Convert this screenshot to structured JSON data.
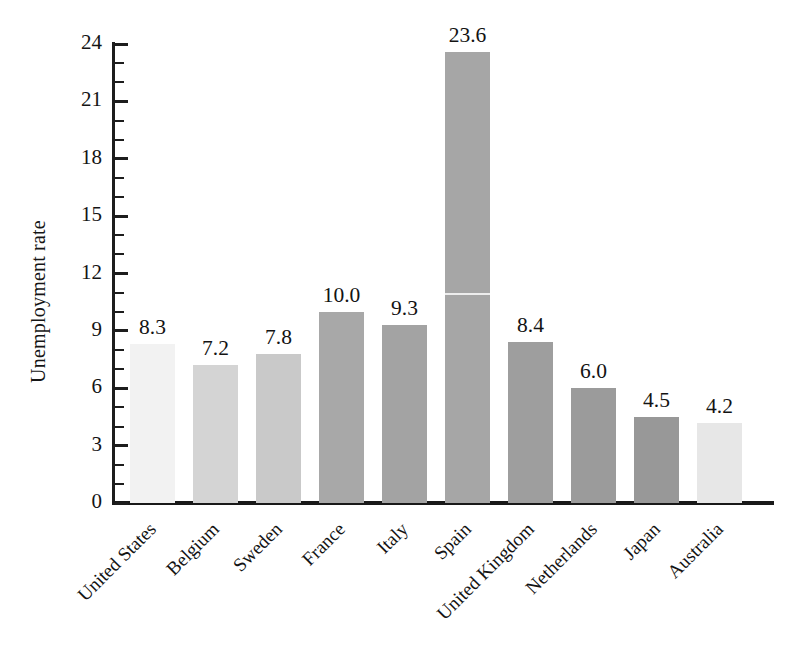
{
  "chart_data": {
    "type": "bar",
    "title": "",
    "xlabel": "",
    "ylabel": "Unemployment rate",
    "ylim": [
      0,
      24
    ],
    "ytick_step": 3,
    "yminor_step": 1,
    "grid": false,
    "legend": "none",
    "categories": [
      "United States",
      "Belgium",
      "Sweden",
      "France",
      "Italy",
      "Spain",
      "United Kingdom",
      "Netherlands",
      "Japan",
      "Australia"
    ],
    "values": [
      8.3,
      7.2,
      7.8,
      10.0,
      9.3,
      23.6,
      8.4,
      6.0,
      4.5,
      4.2
    ],
    "value_labels": [
      "8.3",
      "7.2",
      "7.8",
      "10.0",
      "9.3",
      "23.6",
      "8.4",
      "6.0",
      "4.5",
      "4.2"
    ],
    "ytick_labels": [
      "0",
      "3",
      "6",
      "9",
      "12",
      "15",
      "18",
      "21",
      "24"
    ],
    "ytick_values": [
      0,
      3,
      6,
      9,
      12,
      15,
      18,
      21,
      24
    ],
    "bar_colors": [
      "#f2f2f2",
      "#d4d4d4",
      "#c9c9c9",
      "#a8a8a8",
      "#a3a3a3",
      "#a6a6a6",
      "#9e9e9e",
      "#9b9b9b",
      "#989898",
      "#e7e7e7"
    ]
  },
  "axis": {
    "y_title": "Unemployment rate"
  }
}
